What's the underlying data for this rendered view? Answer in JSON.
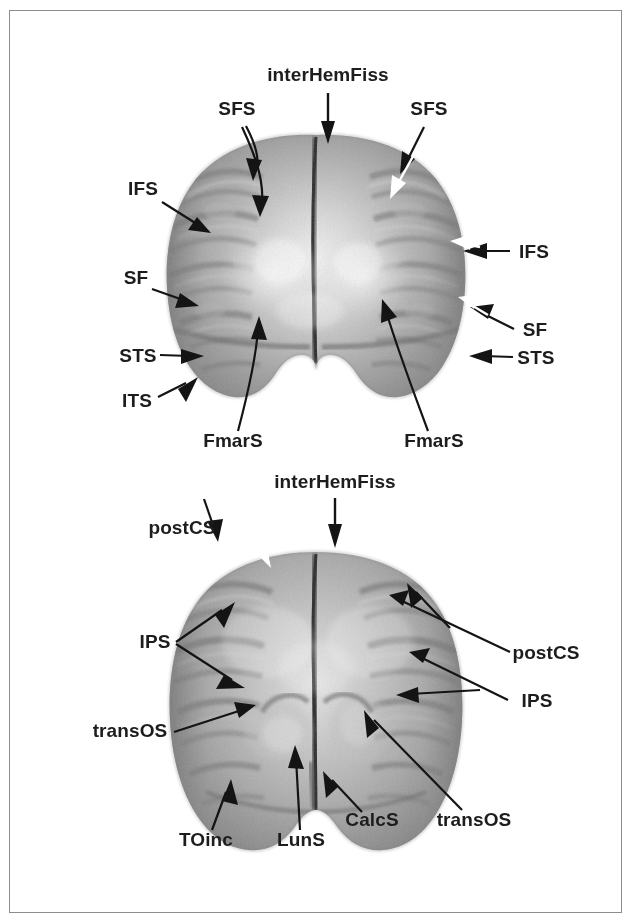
{
  "figure": {
    "border_color": "#8d8d8d",
    "background_color": "#ffffff",
    "label_color": "#1d1d1d",
    "arrow_black_color": "#141414",
    "arrow_white_color": "#ffffff",
    "panel_count": 2
  },
  "panels": [
    {
      "id": "upper-panel",
      "view": "anterior-frontal-view",
      "labels": [
        {
          "id": "interHemFiss-top",
          "text": "interHemFiss",
          "x": 318,
          "y": 70,
          "anchor": "middle",
          "arrow": "down",
          "arrow_color": "black"
        },
        {
          "id": "sfs-left",
          "text": "SFS",
          "x": 227,
          "y": 104,
          "anchor": "middle",
          "arrow": "down-right",
          "arrow_color": "black"
        },
        {
          "id": "sfs-right",
          "text": "SFS",
          "x": 419,
          "y": 104,
          "anchor": "middle",
          "arrow": "down-left",
          "arrow_color": "black-and-white"
        },
        {
          "id": "ifs-left",
          "text": "IFS",
          "x": 133,
          "y": 184,
          "anchor": "middle",
          "arrow": "down-right",
          "arrow_color": "black"
        },
        {
          "id": "ifs-right",
          "text": "IFS",
          "x": 524,
          "y": 240,
          "anchor": "middle",
          "arrow": "left",
          "arrow_color": "black-and-white"
        },
        {
          "id": "sf-left",
          "text": "SF",
          "x": 126,
          "y": 273,
          "anchor": "middle",
          "arrow": "right",
          "arrow_color": "black"
        },
        {
          "id": "sf-right",
          "text": "SF",
          "x": 525,
          "y": 322,
          "anchor": "middle",
          "arrow": "up-left",
          "arrow_color": "black-and-white"
        },
        {
          "id": "sts-left",
          "text": "STS",
          "x": 128,
          "y": 345,
          "anchor": "middle",
          "arrow": "right",
          "arrow_color": "black"
        },
        {
          "id": "sts-right",
          "text": "STS",
          "x": 526,
          "y": 349,
          "anchor": "middle",
          "arrow": "left",
          "arrow_color": "black"
        },
        {
          "id": "its-left",
          "text": "ITS",
          "x": 127,
          "y": 393,
          "anchor": "middle",
          "arrow": "up-right",
          "arrow_color": "black"
        },
        {
          "id": "fmars-left",
          "text": "FmarS",
          "x": 223,
          "y": 432,
          "anchor": "middle",
          "arrow": "up-right",
          "arrow_color": "black"
        },
        {
          "id": "fmars-right",
          "text": "FmarS",
          "x": 424,
          "y": 432,
          "anchor": "middle",
          "arrow": "up-left",
          "arrow_color": "black"
        }
      ]
    },
    {
      "id": "lower-panel",
      "view": "posterior-occipital-view",
      "labels": [
        {
          "id": "interHemFiss-bottom",
          "text": "interHemFiss",
          "x": 325,
          "y": 486,
          "anchor": "middle",
          "arrow": "down",
          "arrow_color": "black"
        },
        {
          "id": "postcs-left",
          "text": "postCS",
          "x": 172,
          "y": 525,
          "anchor": "middle",
          "arrow": "down-right",
          "arrow_color": "black-and-white"
        },
        {
          "id": "postcs-right",
          "text": "postCS",
          "x": 533,
          "y": 650,
          "anchor": "middle",
          "arrow": "up-left",
          "arrow_color": "black"
        },
        {
          "id": "ips-left",
          "text": "IPS",
          "x": 145,
          "y": 636,
          "anchor": "middle",
          "arrow": "up-right",
          "arrow_color": "black"
        },
        {
          "id": "ips-right",
          "text": "IPS",
          "x": 527,
          "y": 694,
          "anchor": "middle",
          "arrow": "up-left",
          "arrow_color": "black"
        },
        {
          "id": "transos-left",
          "text": "transOS",
          "x": 120,
          "y": 725,
          "anchor": "middle",
          "arrow": "right",
          "arrow_color": "black"
        },
        {
          "id": "toinc",
          "text": "TOinc",
          "x": 195,
          "y": 831,
          "anchor": "middle",
          "arrow": "up-right",
          "arrow_color": "black"
        },
        {
          "id": "luns",
          "text": "LunS",
          "x": 291,
          "y": 831,
          "anchor": "middle",
          "arrow": "up",
          "arrow_color": "black"
        },
        {
          "id": "calcs",
          "text": "CalcS",
          "x": 360,
          "y": 814,
          "anchor": "middle",
          "arrow": "up-left",
          "arrow_color": "black"
        },
        {
          "id": "transos-right",
          "text": "transOS",
          "x": 462,
          "y": 814,
          "anchor": "middle",
          "arrow": "up-left",
          "arrow_color": "black"
        }
      ]
    }
  ],
  "abbreviations": {
    "interHemFiss": "interhemispheric fissure",
    "SFS": "superior frontal sulcus",
    "IFS": "inferior frontal sulcus",
    "SF": "Sylvian fissure",
    "STS": "superior temporal sulcus",
    "ITS": "inferior temporal sulcus",
    "FmarS": "fronto-marginal sulcus",
    "postCS": "postcentral sulcus",
    "IPS": "intraparietal sulcus",
    "transOS": "transverse occipital sulcus",
    "TOinc": "temporo-occipital incisure",
    "LunS": "lunate sulcus",
    "CalcS": "calcarine sulcus"
  }
}
